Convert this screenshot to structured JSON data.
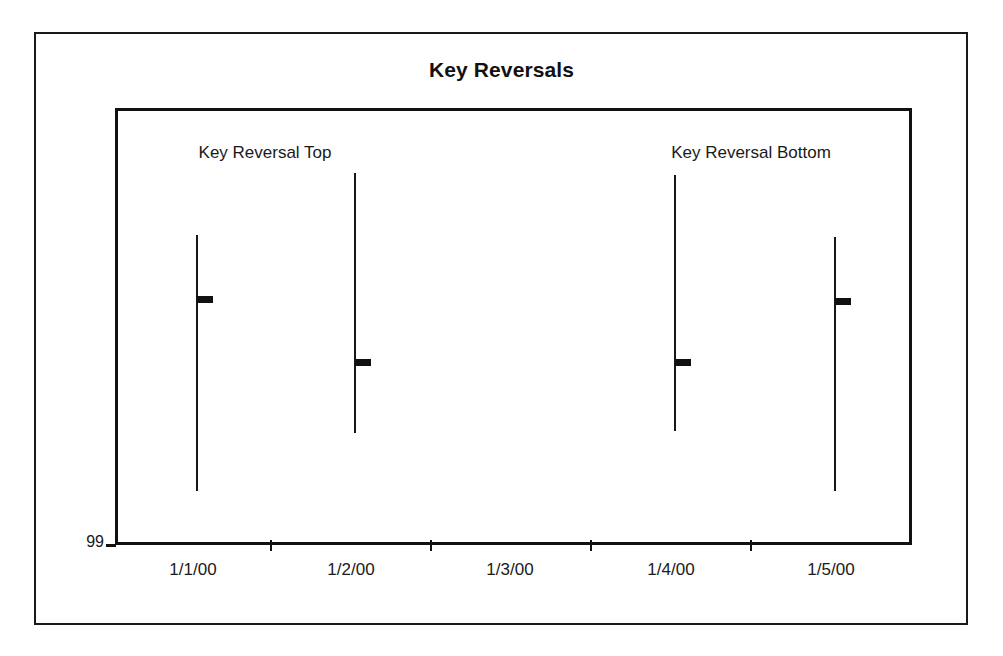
{
  "figure": {
    "title": "Key Reversals",
    "background_color": "#ffffff",
    "frame_color": "#1a1a1a",
    "ink_color": "#111111"
  },
  "annotations": [
    {
      "id": "key-reversal-top",
      "text": "Key Reversal Top",
      "x_center_px": 262,
      "y_px": 140
    },
    {
      "id": "key-reversal-bottom",
      "text": "Key Reversal Bottom",
      "x_center_px": 748,
      "y_px": 140
    }
  ],
  "y_axis": {
    "labels": [
      "99"
    ],
    "first_label": "99"
  },
  "x_axis": {
    "labels": [
      "1/1/00",
      "1/2/00",
      "1/3/00",
      "1/4/00",
      "1/5/00"
    ],
    "tick_boundaries_px": [
      115,
      270,
      430,
      590,
      750,
      912
    ],
    "category_centers_px": [
      193,
      351,
      510,
      671,
      831
    ]
  },
  "chart_data": {
    "type": "ohlc",
    "title": "Key Reversals",
    "xlabel": "",
    "ylabel": "",
    "categories": [
      "1/1/00",
      "1/2/00",
      "1/3/00",
      "1/4/00",
      "1/5/00"
    ],
    "ylim": [
      99,
      108.4
    ],
    "grid": false,
    "legend": false,
    "y_tick_labels": [
      "99"
    ],
    "note": "Open-High-Low-Close style bars: vertical line spans high-to-low, the short right-hand tab marks the close. No bar is drawn for 1/3/00. Values derived from pixel geometry with baseline 99 at y=545 px and plot top y=108 px.",
    "series": [
      {
        "name": "Price bars",
        "points": [
          {
            "category": "1/1/00",
            "high": 105.72,
            "low": 100.22,
            "close": 104.35,
            "x_px": 193,
            "top_px": 232,
            "bottom_px": 488,
            "close_px": 296
          },
          {
            "category": "1/2/00",
            "high": 107.05,
            "low": 101.47,
            "close": 102.99,
            "x_px": 351,
            "top_px": 170,
            "bottom_px": 430,
            "close_px": 359
          },
          {
            "category": "1/3/00",
            "high": null,
            "low": null,
            "close": null,
            "x_px": 510,
            "top_px": null,
            "bottom_px": null,
            "close_px": null
          },
          {
            "category": "1/4/00",
            "high": 107.01,
            "low": 101.51,
            "close": 102.99,
            "x_px": 671,
            "top_px": 172,
            "bottom_px": 428,
            "close_px": 359
          },
          {
            "category": "1/5/00",
            "high": 105.68,
            "low": 100.22,
            "close": 104.31,
            "x_px": 831,
            "top_px": 234,
            "bottom_px": 488,
            "close_px": 298
          }
        ],
        "annotated": {
          "1/1/00": "Key Reversal Top",
          "1/4/00": "Key Reversal Bottom"
        }
      }
    ]
  }
}
